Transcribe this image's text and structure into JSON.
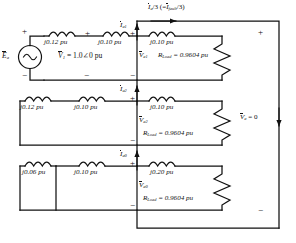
{
  "diagram": {
    "top_current": {
      "main": "I",
      "main_sub": "a",
      "expr": "/3 (=",
      "alt": "I",
      "alt_sub": "fault",
      "expr_end": "/3)"
    },
    "source": {
      "symbol": "E",
      "sub": "a",
      "icon": "ac-source-icon"
    },
    "v1_label": {
      "symbol": "V",
      "sub": "1",
      "value": "= 1.0∠0 pu"
    },
    "right_rail": {
      "plus": "+",
      "minus": "−",
      "label_symbol": "V",
      "label_sub": "a",
      "label_value": "= 0"
    },
    "rows": [
      {
        "id": "positive-sequence",
        "current": {
          "symbol": "I",
          "sub": "a1"
        },
        "voltage": {
          "symbol": "V",
          "sub": "a1"
        },
        "inductors": [
          "j0.12 pu",
          "j0.10 pu",
          "j0.10 pu"
        ],
        "resistor": {
          "symbol": "R",
          "sub": "Load",
          "value": "= 0.9604 pu"
        },
        "plus": "+",
        "minus": "−"
      },
      {
        "id": "negative-sequence",
        "current": {
          "symbol": "I",
          "sub": "a2"
        },
        "voltage": {
          "symbol": "V",
          "sub": "a2"
        },
        "inductors": [
          "j0.12 pu",
          "j0.10 pu",
          "j0.10 pu"
        ],
        "resistor": {
          "symbol": "R",
          "sub": "Load",
          "value": "= 0.9604 pu"
        },
        "plus": "+",
        "minus": "−"
      },
      {
        "id": "zero-sequence",
        "current": {
          "symbol": "I",
          "sub": "a0"
        },
        "voltage": {
          "symbol": "V",
          "sub": "a0"
        },
        "inductors": [
          "j0.06 pu",
          "j0.10 pu",
          "j0.20 pu"
        ],
        "resistor": {
          "symbol": "R",
          "sub": "Load",
          "value": "= 0.9604 pu"
        },
        "plus": "+",
        "minus": "−"
      }
    ],
    "source_signs": {
      "plus": "+",
      "minus": "−"
    },
    "node_signs": {
      "plus": "+",
      "minus": "−"
    },
    "colors": {
      "line": "#111111",
      "background": "#ffffff"
    }
  }
}
